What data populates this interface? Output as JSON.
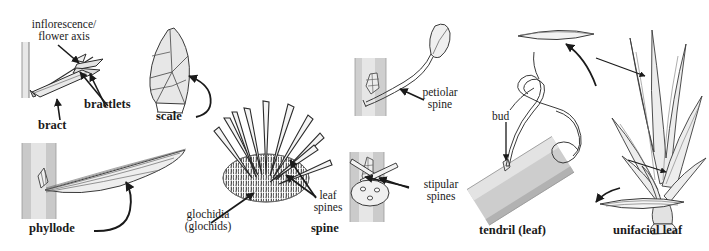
{
  "figure": {
    "background_color": "#ffffff",
    "ink_color": "#1a1a1a",
    "stem_fill": "#c8c8c8",
    "stem_fill_light": "#e3e3e3",
    "organ_fill": "#ededed",
    "organ_fill_dark": "#d6d6d6"
  },
  "panels": [
    {
      "key": "bract",
      "name": "bract-panel",
      "labels": {
        "axis": "inflorescence/\nflower axis",
        "bractlets": "bractlets",
        "bract": "bract"
      }
    },
    {
      "key": "scale",
      "name": "scale-panel",
      "labels": {
        "scale": "scale"
      }
    },
    {
      "key": "phyllode",
      "name": "phyllode-panel",
      "labels": {
        "phyllode": "phyllode"
      }
    },
    {
      "key": "spine",
      "name": "spine-panel",
      "labels": {
        "glochidia": "glochidia\n(glochids)",
        "leaf_spines": "leaf\nspines",
        "spine": "spine"
      }
    },
    {
      "key": "petiolar",
      "name": "petiolar-spine-panel",
      "labels": {
        "petiolar_spine": "petiolar\nspine"
      }
    },
    {
      "key": "stipular",
      "name": "stipular-spines-panel",
      "labels": {
        "stipular_spines": "stipular\nspines"
      }
    },
    {
      "key": "tendril",
      "name": "tendril-panel",
      "labels": {
        "bud": "bud",
        "tendril": "tendril (leaf)"
      }
    },
    {
      "key": "unifacial",
      "name": "unifacial-leaf-panel",
      "labels": {
        "unifacial_leaf": "unifacial leaf"
      }
    }
  ]
}
